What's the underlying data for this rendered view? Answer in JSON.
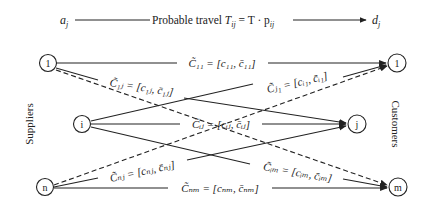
{
  "header": {
    "left": "a",
    "left_sub": "j",
    "text": "Probable travel",
    "formula_T": "T",
    "formula_sub": "ij",
    "formula_rest": " = T · p",
    "formula_rest_sub": "ij",
    "right": "d",
    "right_sub": "j"
  },
  "sides": {
    "left": "Suppliers",
    "right": "Customers"
  },
  "nodes": {
    "suppliers": [
      {
        "id": "s1",
        "label": "1"
      },
      {
        "id": "si",
        "label": "i"
      },
      {
        "id": "sn",
        "label": "n"
      }
    ],
    "customers": [
      {
        "id": "c1",
        "label": "1"
      },
      {
        "id": "cj",
        "label": "j"
      },
      {
        "id": "cm",
        "label": "m"
      }
    ]
  },
  "edges": {
    "e11": {
      "from": "1",
      "to": "1",
      "style": "solid",
      "label": "C̃₁₁ = [c₁₁, c̄₁₁]"
    },
    "e1j": {
      "from": "1",
      "to": "j",
      "style": "solid",
      "label": "C̃₁ⱼ = [c₁ⱼ, c̄₁ⱼ]"
    },
    "e1m": {
      "from": "1",
      "to": "m",
      "style": "dashed",
      "label": ""
    },
    "ei1": {
      "from": "i",
      "to": "1",
      "style": "solid",
      "label": "C̃ⱼ₁ = [cᵢ₁, c̄ᵢ₁]"
    },
    "eij": {
      "from": "i",
      "to": "j",
      "style": "solid",
      "label": "C̃ᵢⱼ = [cᵢⱼ, c̄ᵢⱼ]"
    },
    "eim": {
      "from": "i",
      "to": "m",
      "style": "solid",
      "label": "C̃ᵢₘ = [cᵢₘ, c̄ᵢₘ]"
    },
    "en1": {
      "from": "n",
      "to": "1",
      "style": "dashed",
      "label": ""
    },
    "enj": {
      "from": "n",
      "to": "j",
      "style": "solid",
      "label": "C̃ₙⱼ = [cₙⱼ, c̄ₙⱼ]"
    },
    "enm": {
      "from": "n",
      "to": "m",
      "style": "solid",
      "label": "C̃ₙₘ = [cₙₘ, c̄ₙₘ]"
    }
  }
}
